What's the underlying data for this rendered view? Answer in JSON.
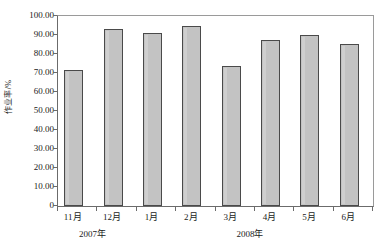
{
  "chart_data": {
    "type": "bar",
    "title": "",
    "xlabel": "",
    "ylabel": "作业率/%",
    "categories": [
      "11月",
      "12月",
      "1月",
      "2月",
      "3月",
      "4月",
      "5月",
      "6月"
    ],
    "values": [
      71.6,
      93.0,
      91.0,
      94.5,
      73.5,
      87.2,
      90.2,
      85.2
    ],
    "ylim": [
      0,
      100
    ],
    "ytick_labels": [
      "100.00",
      "90.00",
      "80.00",
      "70.00",
      "60.00",
      "50.00",
      "40.00",
      "30.00",
      "20.00",
      "10.00",
      "0"
    ],
    "ytick_values": [
      100,
      90,
      80,
      70,
      60,
      50,
      40,
      30,
      20,
      10,
      0
    ],
    "grid": false,
    "legend": "none",
    "groups": [
      {
        "label": "2007年",
        "categories": [
          "11月",
          "12月"
        ]
      },
      {
        "label": "2008年",
        "categories": [
          "1月",
          "2月",
          "3月",
          "4月",
          "5月",
          "6月"
        ]
      }
    ],
    "colors": {
      "bar_fill": "#c3c3c3",
      "bar_border": "#4a4a4a",
      "axis": "#6b6b6b",
      "background": "#ffffff",
      "text": "#1a1a1a"
    }
  }
}
